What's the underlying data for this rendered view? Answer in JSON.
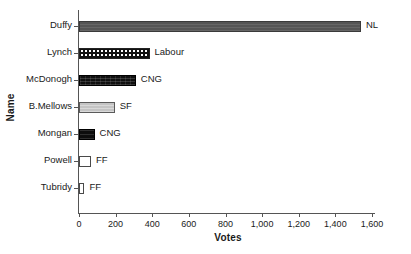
{
  "chart_data": {
    "type": "bar",
    "orientation": "horizontal",
    "title": "",
    "xlabel": "Votes",
    "ylabel": "Name",
    "categories": [
      "Duffy",
      "Lynch",
      "McDonogh",
      "B.Mellows",
      "Mongan",
      "Powell",
      "Tubridy"
    ],
    "values": [
      1540,
      385,
      310,
      195,
      85,
      65,
      30
    ],
    "annotations": [
      "NL",
      "Labour",
      "CNG",
      "SF",
      "CNG",
      "FF",
      "FF"
    ],
    "xlim": [
      0,
      1600
    ],
    "xticks": [
      0,
      200,
      400,
      600,
      800,
      1000,
      1200,
      1400,
      1600
    ],
    "xtick_labels": [
      "0",
      "200",
      "400",
      "600",
      "800",
      "1,000",
      "1,200",
      "1,400",
      "1,600"
    ],
    "grid": false,
    "legend": "none",
    "bar_styles": [
      "dark-gray-solid",
      "black-white-checkerboard",
      "black-textured",
      "light-gray-solid",
      "black-solid",
      "white-unfilled",
      "white-unfilled"
    ],
    "colors": {
      "dark_gray": "#555555",
      "light_gray": "#c4c4c4",
      "black": "#0d0d0d",
      "white": "#ffffff",
      "axis": "#555555",
      "text": "#1a1a1a"
    },
    "bars": [
      {
        "name": "Duffy",
        "votes": 1540,
        "party": "NL",
        "style": "fill-darkgray"
      },
      {
        "name": "Lynch",
        "votes": 385,
        "party": "Labour",
        "style": "fill-checker"
      },
      {
        "name": "McDonogh",
        "votes": 310,
        "party": "CNG",
        "style": "fill-black-texture"
      },
      {
        "name": "B.Mellows",
        "votes": 195,
        "party": "SF",
        "style": "fill-lightgray"
      },
      {
        "name": "Mongan",
        "votes": 85,
        "party": "CNG",
        "style": "fill-black"
      },
      {
        "name": "Powell",
        "votes": 65,
        "party": "FF",
        "style": "fill-white"
      },
      {
        "name": "Tubridy",
        "votes": 30,
        "party": "FF",
        "style": "fill-white"
      }
    ]
  }
}
